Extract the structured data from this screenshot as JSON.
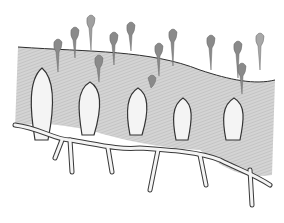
{
  "figure": {
    "signature": "",
    "colors": {
      "background": "#ffffff",
      "tissue": "#c8c8c8",
      "tissue_shadow": "#9a9a9a",
      "vessel_fill": "#f2f2f2",
      "vessel_outline": "#3a3a3a",
      "surface_line": "#2e2e2e",
      "drops": "#8a8a8a"
    },
    "loops": [
      {
        "x": 42,
        "top": 70
      },
      {
        "x": 88,
        "top": 83
      },
      {
        "x": 137,
        "top": 89
      },
      {
        "x": 182,
        "top": 99
      },
      {
        "x": 233,
        "top": 100
      }
    ],
    "drops": [
      {
        "x": 57,
        "y": 40
      },
      {
        "x": 74,
        "y": 30
      },
      {
        "x": 90,
        "y": 18
      },
      {
        "x": 98,
        "y": 60
      },
      {
        "x": 113,
        "y": 35
      },
      {
        "x": 130,
        "y": 25
      },
      {
        "x": 145,
        "y": 48
      },
      {
        "x": 158,
        "y": 48
      },
      {
        "x": 172,
        "y": 32
      },
      {
        "x": 182,
        "y": 50
      },
      {
        "x": 211,
        "y": 40
      },
      {
        "x": 238,
        "y": 45
      },
      {
        "x": 260,
        "y": 37
      },
      {
        "x": 242,
        "y": 68
      },
      {
        "x": 152,
        "y": 80
      }
    ]
  }
}
